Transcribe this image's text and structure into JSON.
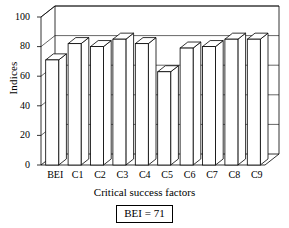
{
  "chart_data": {
    "type": "bar",
    "title": "",
    "xlabel": "Critical success factors",
    "ylabel": "Indices",
    "categories": [
      "BEI",
      "C1",
      "C2",
      "C3",
      "C4",
      "C5",
      "C6",
      "C7",
      "C8",
      "C9"
    ],
    "values": [
      71,
      82,
      80,
      85,
      82,
      63,
      79,
      80,
      85,
      85
    ],
    "ylim": [
      0,
      100
    ],
    "yticks": [
      0,
      20,
      40,
      60,
      80,
      100
    ],
    "ytick_labels": [
      "0",
      "20",
      "40",
      "60",
      "80",
      "100"
    ],
    "grid": true,
    "grid_axis": "y",
    "legend": "none",
    "style": "3d-bar",
    "bar_color": "#ffffff",
    "bar_edge_color": "#000000",
    "annotations": [
      {
        "text": "BEI = 71",
        "boxed": true,
        "position": "below-axis"
      }
    ]
  },
  "axes": {
    "y_label": "Indices",
    "x_label": "Critical success factors"
  },
  "annotation_box": {
    "label": "BEI = 71"
  },
  "colors": {
    "axis": "#000000",
    "grid": "#000000",
    "bar_face": "#ffffff",
    "bar_edge": "#000000",
    "background": "#ffffff"
  }
}
